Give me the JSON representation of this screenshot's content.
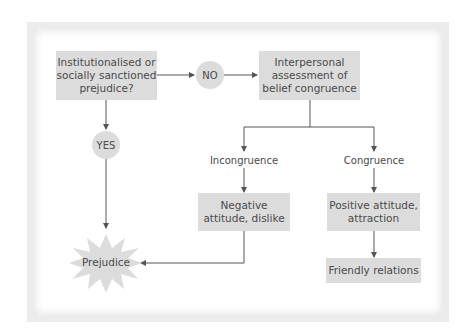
{
  "diagram": {
    "type": "flowchart",
    "nodes": {
      "question": "Institutionalised or socially sanctioned prejudice?",
      "no": "NO",
      "yes": "YES",
      "assessment": "Interpersonal assessment of belief congruence",
      "incongruence": "Incongruence",
      "congruence": "Congruence",
      "negative": "Negative attitude, dislike",
      "positive": "Positive attitude, attraction",
      "friendly": "Friendly relations",
      "prejudice": "Prejudice"
    },
    "edges": [
      {
        "from": "question",
        "to": "no"
      },
      {
        "from": "no",
        "to": "assessment"
      },
      {
        "from": "question",
        "to": "yes"
      },
      {
        "from": "yes",
        "to": "prejudice"
      },
      {
        "from": "assessment",
        "to": "incongruence"
      },
      {
        "from": "assessment",
        "to": "congruence"
      },
      {
        "from": "incongruence",
        "to": "negative"
      },
      {
        "from": "congruence",
        "to": "positive"
      },
      {
        "from": "positive",
        "to": "friendly"
      },
      {
        "from": "negative",
        "to": "prejudice"
      }
    ],
    "colors": {
      "node_fill": "#dcdcdc",
      "line": "#555555",
      "text": "#4a4a4a",
      "frame_border": "#e6e6e6"
    }
  }
}
